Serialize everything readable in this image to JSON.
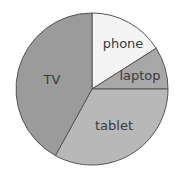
{
  "chart_data": {
    "type": "pie",
    "title": "",
    "categories": [
      "phone",
      "laptop",
      "tablet",
      "TV"
    ],
    "values": [
      16,
      9,
      33,
      42
    ],
    "unit": "percent (estimated from slice angles)",
    "start_angle_deg": -90,
    "direction": "clockwise",
    "colors": [
      "#f4f4f4",
      "#a8a8a8",
      "#b8b8b8",
      "#9b9b9b"
    ],
    "legend": "none (labels drawn inside slices)"
  },
  "labels": {
    "phone": "phone",
    "laptop": "laptop",
    "tablet": "tablet",
    "tv": "TV"
  }
}
